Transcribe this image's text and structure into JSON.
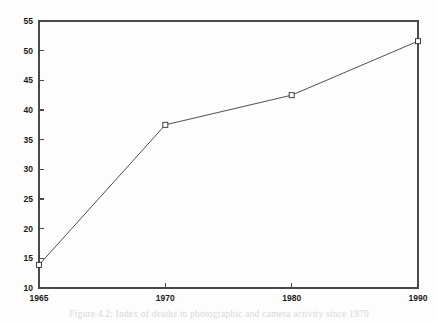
{
  "figure": {
    "caption": "Figure 4.2: Index of deaths in photographic and camera activity since 1970",
    "background_color": "#fdfdfd",
    "line_color": "#3c3c3c",
    "axis_color": "#4a4a4a",
    "marker_fill": "#fbfbfb"
  },
  "chart_data": {
    "type": "line",
    "title": "",
    "xlabel": "",
    "ylabel": "",
    "categories": [
      "1965",
      "1970",
      "1980",
      "1990"
    ],
    "x": [
      1965,
      1970,
      1980,
      1990
    ],
    "values": [
      13.9,
      37.5,
      42.5,
      51.6
    ],
    "series": [
      {
        "name": "series-1",
        "values": [
          13.9,
          37.5,
          42.5,
          51.6
        ],
        "marker": "open-square",
        "color": "#3c3c3c"
      }
    ],
    "ylim": [
      10,
      55
    ],
    "yticks": [
      10,
      15,
      20,
      25,
      30,
      35,
      40,
      45,
      50,
      55
    ],
    "ytick_labels": [
      "10",
      "15",
      "20",
      "25",
      "30",
      "35",
      "40",
      "45",
      "50",
      "55"
    ],
    "xticks": [
      1965,
      1970,
      1980,
      1990
    ],
    "xtick_labels": [
      "1965",
      "1970",
      "1980",
      "1990"
    ],
    "grid": false,
    "legend": false,
    "legend_position": "none",
    "x_spacing": "categorical-equal",
    "frame": "full-box"
  }
}
